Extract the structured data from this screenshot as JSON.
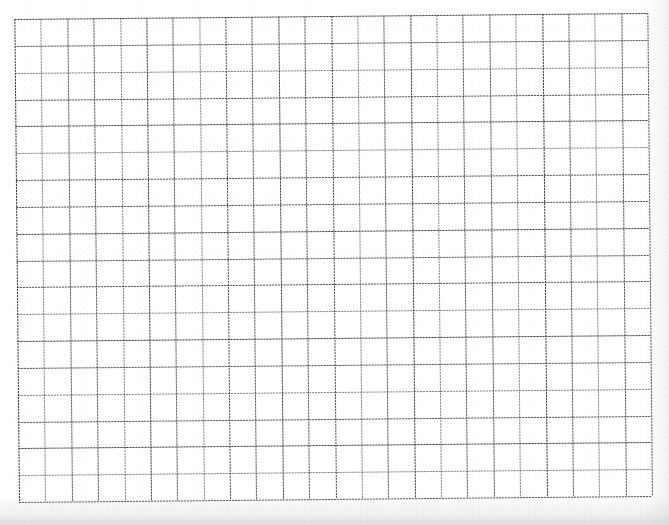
{
  "document": {
    "kind": "scanned-grid-paper",
    "title": "Blank graph paper sheet",
    "description": "Scanned sheet of blank square-ruled graph paper with no writing or markings.",
    "content_text": ""
  },
  "sheet": {
    "width_px": 669,
    "height_px": 525,
    "background_color": "#ffffff",
    "paper_tone_color": "#fcfcfc",
    "shadow_color": "#bab9b5"
  },
  "grid": {
    "columns": 24,
    "rows": 18,
    "cell_width_px": 26.4,
    "cell_height_px": 26.8,
    "left_px": 19,
    "top_px": 19,
    "width_px": 633,
    "height_px": 483,
    "line_color": "#3a3a3a",
    "line_width_px": 1,
    "line_style": "dotted",
    "skew_degrees": -0.55
  },
  "annotations": {
    "labels": [],
    "handwriting": [],
    "axis_ticks": []
  }
}
